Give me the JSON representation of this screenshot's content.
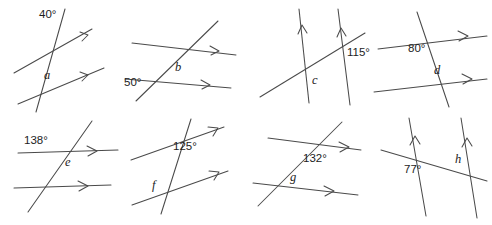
{
  "page": {
    "background_color": "#ffffff",
    "line_color": "#4a4a4a",
    "text_color": "#1d1d1d",
    "layout": {
      "columns": 4,
      "rows": 2,
      "width": 492,
      "height": 225
    }
  },
  "figures": [
    {
      "id": "a",
      "position": "row1-col1",
      "given_angle": "40°",
      "unknown_label": "a",
      "parallel_marks": "single-arrow-right",
      "description": "Two parallel lines sloping gently up to the right, each with a right-pointing arrowhead, cut by a steep transversal falling to the left. The 40° angle is marked above the upper parallel line on the right of the transversal; a is marked above the lower parallel line on the right of the transversal."
    },
    {
      "id": "b",
      "position": "row1-col2",
      "given_angle": "50°",
      "unknown_label": "b",
      "parallel_marks": "single-arrow-right",
      "description": "Two near-horizontal parallel lines with right-pointing arrowheads cut by a transversal rising to the right. 50° sits left of the lower intersection below the line; b sits above and right of the lower intersection."
    },
    {
      "id": "c",
      "position": "row1-col3",
      "given_angle": "115°",
      "unknown_label": "c",
      "parallel_marks": "single-arrow-up",
      "description": "Two steep parallel lines with upward arrowheads cut by a transversal rising gently to the right. 115° is to the right of the right-hand intersection; c is to the right of the left-hand intersection."
    },
    {
      "id": "d",
      "position": "row1-col4",
      "given_angle": "80°",
      "unknown_label": "d",
      "parallel_marks": "single-arrow-right",
      "description": "Two horizontal parallel lines with right-pointing arrowheads cut by a steep transversal falling to the right. 80° sits below-right of the upper intersection; d sits above-right of the lower intersection."
    },
    {
      "id": "e",
      "position": "row2-col1",
      "given_angle": "138°",
      "unknown_label": "e",
      "parallel_marks": "single-arrow-right",
      "description": "Two horizontal parallel lines with right-pointing arrowheads cut by a transversal rising to the right. 138° is above-left of the upper intersection; e is just below-right of it."
    },
    {
      "id": "f",
      "position": "row2-col2",
      "given_angle": "125°",
      "unknown_label": "f",
      "parallel_marks": "single-arrow-right",
      "description": "Two parallel lines sloping up to the right with arrowheads, cut by a steep transversal. 125° sits below-right of the upper intersection; f sits above-left of the lower intersection."
    },
    {
      "id": "g",
      "position": "row2-col3",
      "given_angle": "132°",
      "unknown_label": "g",
      "parallel_marks": "single-arrow-right",
      "description": "Two near-horizontal parallel lines with right arrowheads cut by a transversal rising steeply to the right. 132° is below-right of the upper intersection; g is above-right of the lower intersection."
    },
    {
      "id": "h",
      "position": "row2-col4",
      "given_angle": "77°",
      "unknown_label": "h",
      "parallel_marks": "single-arrow-up",
      "description": "Two steep parallel lines with upward arrowheads cut by a transversal falling gently to the right. 77° is below-right of the left intersection; h is above-left of the right intersection."
    }
  ]
}
